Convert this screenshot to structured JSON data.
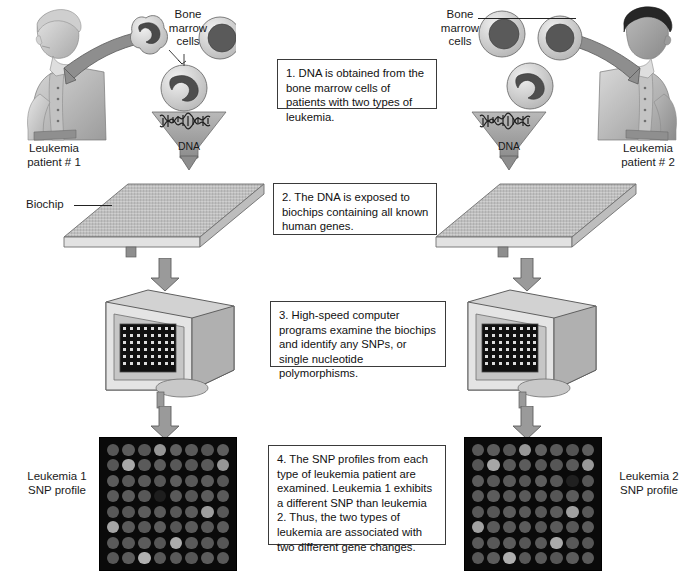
{
  "figure": {
    "type": "process-diagram"
  },
  "labels": {
    "bone_marrow_left": "Bone\nmarrow\ncells",
    "bone_marrow_right": "Bone\nmarrow\ncells",
    "dna_left": "DNA",
    "dna_right": "DNA",
    "patient_left": "Leukemia\npatient # 1",
    "patient_right": "Leukemia\npatient # 2",
    "biochip": "Biochip",
    "snp_profile_left": "Leukemia 1\nSNP profile",
    "snp_profile_right": "Leukemia 2\nSNP profile"
  },
  "steps": [
    {
      "number": "1",
      "text": "1. DNA is obtained from the bone marrow cells of patients with two types of leukemia."
    },
    {
      "number": "2",
      "text": "2. The DNA is exposed to biochips containing all known human genes."
    },
    {
      "number": "3",
      "text": "3. High-speed computer programs examine the biochips and identify any SNPs, or single nucleotide polymorphisms."
    },
    {
      "number": "4",
      "text": "4. The SNP profiles from each type of leukemia patient are examined. Leukemia 1 exhibits a different SNP than leukemia 2. Thus, the two types of leukemia are associated with two different gene changes."
    }
  ],
  "icons": {
    "patient_left": "seated-patient-icon",
    "patient_right": "seated-patient-icon",
    "cells": "bone-marrow-cell-icon",
    "dna": "dna-helix-icon",
    "biochip": "biochip-icon",
    "computer": "crt-monitor-icon",
    "arrow": "down-arrow-icon",
    "snp_grid": "snp-microarray-icon"
  },
  "colors": {
    "ink": "#1a1a1a",
    "box_border": "#3a3a3a",
    "arrow_fill": "#8e8e8e",
    "arrow_stroke": "#555555",
    "chip_bg": "#0a0a0a",
    "panel_light": "#d8d8d8",
    "panel_mid": "#b3b3b3",
    "panel_dark": "#8c8c8c"
  },
  "chart_data": {
    "type": "heatmap",
    "grid": {
      "rows": 8,
      "cols": 8
    },
    "panels": [
      {
        "name": "Leukemia 1 SNP profile",
        "intensities": [
          [
            88,
            92,
            86,
            150,
            96,
            90,
            84,
            94
          ],
          [
            86,
            168,
            90,
            92,
            88,
            86,
            90,
            150
          ],
          [
            92,
            88,
            90,
            86,
            94,
            88,
            92,
            86
          ],
          [
            90,
            92,
            88,
            30,
            90,
            86,
            92,
            90
          ],
          [
            88,
            86,
            92,
            90,
            88,
            92,
            158,
            88
          ],
          [
            165,
            90,
            88,
            92,
            86,
            90,
            88,
            92
          ],
          [
            90,
            88,
            92,
            86,
            172,
            90,
            88,
            86
          ],
          [
            88,
            92,
            176,
            88,
            90,
            86,
            92,
            90
          ]
        ]
      },
      {
        "name": "Leukemia 2 SNP profile",
        "intensities": [
          [
            88,
            92,
            86,
            152,
            96,
            90,
            84,
            94
          ],
          [
            86,
            166,
            90,
            92,
            88,
            86,
            90,
            152
          ],
          [
            92,
            88,
            90,
            86,
            94,
            88,
            32,
            86
          ],
          [
            90,
            92,
            88,
            90,
            90,
            86,
            92,
            90
          ],
          [
            88,
            86,
            92,
            90,
            88,
            92,
            160,
            88
          ],
          [
            162,
            90,
            88,
            92,
            86,
            90,
            88,
            92
          ],
          [
            90,
            88,
            92,
            86,
            90,
            170,
            88,
            86
          ],
          [
            88,
            92,
            174,
            88,
            90,
            86,
            92,
            90
          ]
        ]
      }
    ]
  }
}
